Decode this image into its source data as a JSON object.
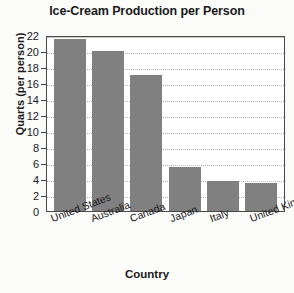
{
  "chart_data": {
    "type": "bar",
    "title": "Ice-Cream Production per Person",
    "xlabel": "Country",
    "ylabel": "Quarts (per person)",
    "categories": [
      "United States",
      "Australia",
      "Canada",
      "Japan",
      "Italy",
      "United Kingdom"
    ],
    "values": [
      21.5,
      20,
      17,
      5.5,
      3.7,
      3.5
    ],
    "ylim": [
      0,
      22
    ],
    "ytick_step": 2,
    "yticks": [
      0,
      2,
      4,
      6,
      8,
      10,
      12,
      14,
      16,
      18,
      20,
      22
    ],
    "ytick_labels": [
      "0",
      "2",
      "4",
      "6",
      "8",
      "10",
      "12",
      "14",
      "16",
      "18",
      "20",
      "22"
    ],
    "grid": true,
    "grid_axis": "y",
    "grid_style": "dotted",
    "legend": false,
    "legend_position": "none",
    "bar_color": "#808080",
    "plot_background": "#ffffff",
    "page_background": "#fbfbfa",
    "axis_color": "#4a4a4a",
    "gridline_color": "#b4b4b4",
    "xtick_rotation": -21
  }
}
